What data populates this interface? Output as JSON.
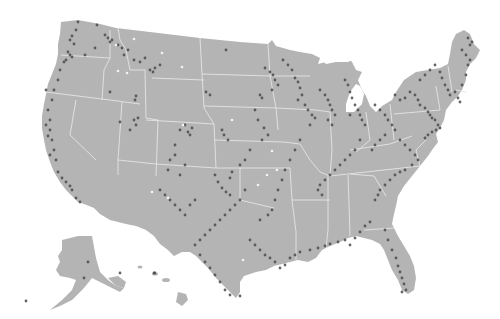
{
  "map": {
    "type": "dot-density map",
    "region": "United States",
    "colors": {
      "background": "#ffffff",
      "land": "#b4b4b4",
      "state_border": "#e4e4e4",
      "dot": "#4a4a4a",
      "highlight_dot": "#f4f4f4"
    },
    "insets": [
      "Alaska",
      "Hawaii"
    ],
    "dots": [
      [
        78,
        22
      ],
      [
        76,
        30
      ],
      [
        72,
        36
      ],
      [
        70,
        40
      ],
      [
        74,
        44
      ],
      [
        68,
        52
      ],
      [
        70,
        55
      ],
      [
        72,
        57
      ],
      [
        66,
        60
      ],
      [
        64,
        62
      ],
      [
        60,
        70
      ],
      [
        58,
        80
      ],
      [
        54,
        90
      ],
      [
        46,
        90
      ],
      [
        52,
        100
      ],
      [
        48,
        110
      ],
      [
        50,
        120
      ],
      [
        46,
        125
      ],
      [
        50,
        130
      ],
      [
        48,
        136
      ],
      [
        52,
        140
      ],
      [
        54,
        150
      ],
      [
        50,
        155
      ],
      [
        56,
        160
      ],
      [
        58,
        172
      ],
      [
        62,
        178
      ],
      [
        66,
        182
      ],
      [
        70,
        186
      ],
      [
        72,
        190
      ],
      [
        76,
        198
      ],
      [
        80,
        202
      ],
      [
        97,
        25
      ],
      [
        105,
        35
      ],
      [
        112,
        40
      ],
      [
        110,
        42
      ],
      [
        108,
        38
      ],
      [
        118,
        45
      ],
      [
        122,
        48
      ],
      [
        85,
        55
      ],
      [
        95,
        48
      ],
      [
        124,
        55
      ],
      [
        128,
        50
      ],
      [
        134,
        60
      ],
      [
        140,
        62
      ],
      [
        145,
        58
      ],
      [
        150,
        70
      ],
      [
        153,
        72
      ],
      [
        155,
        68
      ],
      [
        160,
        65
      ],
      [
        110,
        92
      ],
      [
        136,
        96
      ],
      [
        136,
        125
      ],
      [
        134,
        120
      ],
      [
        138,
        118
      ],
      [
        130,
        130
      ],
      [
        120,
        122
      ],
      [
        135,
        100
      ],
      [
        185,
        125
      ],
      [
        180,
        130
      ],
      [
        188,
        132
      ],
      [
        190,
        135
      ],
      [
        192,
        128
      ],
      [
        175,
        145
      ],
      [
        170,
        160
      ],
      [
        168,
        170
      ],
      [
        180,
        175
      ],
      [
        185,
        165
      ],
      [
        175,
        155
      ],
      [
        226,
        50
      ],
      [
        206,
        92
      ],
      [
        210,
        95
      ],
      [
        222,
        130
      ],
      [
        224,
        135
      ],
      [
        228,
        140
      ],
      [
        265,
        68
      ],
      [
        270,
        72
      ],
      [
        273,
        75
      ],
      [
        275,
        80
      ],
      [
        278,
        85
      ],
      [
        272,
        90
      ],
      [
        260,
        95
      ],
      [
        262,
        98
      ],
      [
        255,
        110
      ],
      [
        258,
        120
      ],
      [
        264,
        128
      ],
      [
        268,
        135
      ],
      [
        262,
        140
      ],
      [
        250,
        150
      ],
      [
        245,
        160
      ],
      [
        240,
        165
      ],
      [
        232,
        172
      ],
      [
        230,
        178
      ],
      [
        283,
        60
      ],
      [
        288,
        65
      ],
      [
        292,
        70
      ],
      [
        295,
        78
      ],
      [
        298,
        82
      ],
      [
        300,
        88
      ],
      [
        302,
        95
      ],
      [
        298,
        100
      ],
      [
        305,
        105
      ],
      [
        308,
        110
      ],
      [
        312,
        115
      ],
      [
        315,
        118
      ],
      [
        310,
        125
      ],
      [
        320,
        90
      ],
      [
        325,
        95
      ],
      [
        328,
        100
      ],
      [
        330,
        105
      ],
      [
        332,
        110
      ],
      [
        335,
        115
      ],
      [
        328,
        120
      ],
      [
        332,
        125
      ],
      [
        345,
        80
      ],
      [
        348,
        85
      ],
      [
        350,
        92
      ],
      [
        352,
        98
      ],
      [
        355,
        105
      ],
      [
        358,
        110
      ],
      [
        350,
        115
      ],
      [
        360,
        115
      ],
      [
        362,
        120
      ],
      [
        365,
        125
      ],
      [
        375,
        105
      ],
      [
        380,
        110
      ],
      [
        385,
        115
      ],
      [
        388,
        120
      ],
      [
        392,
        125
      ],
      [
        395,
        130
      ],
      [
        385,
        135
      ],
      [
        380,
        140
      ],
      [
        375,
        145
      ],
      [
        372,
        150
      ],
      [
        395,
        95
      ],
      [
        400,
        100
      ],
      [
        405,
        98
      ],
      [
        410,
        92
      ],
      [
        415,
        95
      ],
      [
        418,
        100
      ],
      [
        420,
        105
      ],
      [
        425,
        108
      ],
      [
        428,
        112
      ],
      [
        430,
        115
      ],
      [
        432,
        118
      ],
      [
        435,
        120
      ],
      [
        438,
        125
      ],
      [
        440,
        128
      ],
      [
        436,
        130
      ],
      [
        432,
        132
      ],
      [
        428,
        135
      ],
      [
        425,
        138
      ],
      [
        420,
        80
      ],
      [
        425,
        75
      ],
      [
        430,
        70
      ],
      [
        435,
        65
      ],
      [
        440,
        72
      ],
      [
        442,
        78
      ],
      [
        445,
        85
      ],
      [
        448,
        90
      ],
      [
        450,
        95
      ],
      [
        455,
        92
      ],
      [
        458,
        98
      ],
      [
        460,
        102
      ],
      [
        462,
        85
      ],
      [
        466,
        75
      ],
      [
        468,
        65
      ],
      [
        470,
        60
      ],
      [
        466,
        55
      ],
      [
        462,
        50
      ],
      [
        470,
        45
      ],
      [
        468,
        38
      ],
      [
        472,
        42
      ],
      [
        400,
        140
      ],
      [
        405,
        145
      ],
      [
        410,
        150
      ],
      [
        415,
        155
      ],
      [
        418,
        160
      ],
      [
        412,
        165
      ],
      [
        405,
        170
      ],
      [
        400,
        172
      ],
      [
        395,
        175
      ],
      [
        390,
        180
      ],
      [
        385,
        185
      ],
      [
        380,
        190
      ],
      [
        378,
        195
      ],
      [
        375,
        200
      ],
      [
        360,
        140
      ],
      [
        355,
        150
      ],
      [
        350,
        155
      ],
      [
        345,
        160
      ],
      [
        340,
        165
      ],
      [
        335,
        170
      ],
      [
        330,
        175
      ],
      [
        325,
        180
      ],
      [
        320,
        185
      ],
      [
        318,
        190
      ],
      [
        322,
        195
      ],
      [
        300,
        140
      ],
      [
        295,
        150
      ],
      [
        290,
        160
      ],
      [
        285,
        170
      ],
      [
        282,
        180
      ],
      [
        278,
        190
      ],
      [
        275,
        200
      ],
      [
        272,
        210
      ],
      [
        268,
        215
      ],
      [
        260,
        220
      ],
      [
        245,
        190
      ],
      [
        240,
        200
      ],
      [
        235,
        205
      ],
      [
        230,
        210
      ],
      [
        225,
        215
      ],
      [
        220,
        220
      ],
      [
        215,
        225
      ],
      [
        210,
        230
      ],
      [
        205,
        235
      ],
      [
        200,
        240
      ],
      [
        195,
        245
      ],
      [
        250,
        240
      ],
      [
        255,
        245
      ],
      [
        260,
        250
      ],
      [
        265,
        255
      ],
      [
        270,
        258
      ],
      [
        275,
        262
      ],
      [
        280,
        268
      ],
      [
        285,
        265
      ],
      [
        290,
        258
      ],
      [
        295,
        255
      ],
      [
        300,
        252
      ],
      [
        310,
        250
      ],
      [
        318,
        248
      ],
      [
        325,
        246
      ],
      [
        330,
        244
      ],
      [
        338,
        242
      ],
      [
        345,
        240
      ],
      [
        350,
        245
      ],
      [
        355,
        238
      ],
      [
        360,
        232
      ],
      [
        365,
        226
      ],
      [
        370,
        222
      ],
      [
        385,
        230
      ],
      [
        388,
        240
      ],
      [
        392,
        250
      ],
      [
        396,
        258
      ],
      [
        398,
        266
      ],
      [
        400,
        272
      ],
      [
        402,
        278
      ],
      [
        404,
        284
      ],
      [
        406,
        290
      ],
      [
        402,
        292
      ],
      [
        200,
        255
      ],
      [
        205,
        262
      ],
      [
        210,
        268
      ],
      [
        215,
        275
      ],
      [
        220,
        282
      ],
      [
        225,
        290
      ],
      [
        230,
        295
      ],
      [
        240,
        296
      ],
      [
        160,
        190
      ],
      [
        165,
        195
      ],
      [
        170,
        200
      ],
      [
        175,
        205
      ],
      [
        180,
        210
      ],
      [
        185,
        215
      ],
      [
        190,
        205
      ],
      [
        195,
        200
      ],
      [
        215,
        175
      ],
      [
        218,
        182
      ],
      [
        222,
        188
      ],
      [
        226,
        192
      ],
      [
        230,
        195
      ],
      [
        88,
        262
      ],
      [
        84,
        278
      ],
      [
        120,
        273
      ],
      [
        26,
        301
      ],
      [
        155,
        273
      ],
      [
        154,
        273
      ]
    ],
    "white_dots": [
      [
        116,
        45
      ],
      [
        118,
        71
      ],
      [
        127,
        73
      ],
      [
        134,
        39
      ],
      [
        162,
        53
      ],
      [
        182,
        67
      ],
      [
        183,
        125
      ],
      [
        152,
        192
      ],
      [
        168,
        198
      ],
      [
        232,
        120
      ],
      [
        272,
        151
      ],
      [
        267,
        175
      ],
      [
        258,
        185
      ],
      [
        277,
        170
      ],
      [
        243,
        260
      ]
    ]
  }
}
